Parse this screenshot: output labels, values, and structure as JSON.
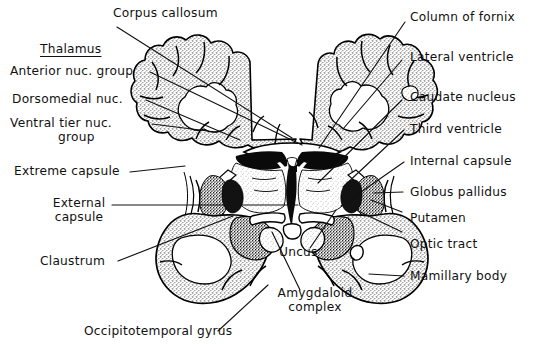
{
  "figure": {
    "ink_color": "#111111",
    "background_color": "#ffffff"
  },
  "labels": {
    "corpus_callosum": "Corpus callosum",
    "thalamus_heading": "Thalamus",
    "anterior_nuc_group": "Anterior nuc. group",
    "dorsomedial_nuc": "Dorsomedial nuc.",
    "ventral_tier_line1": "Ventral tier nuc.",
    "ventral_tier_line2": "group",
    "extreme_capsule": "Extreme capsule",
    "external_capsule_line1": "External",
    "external_capsule_line2": "capsule",
    "claustrum": "Claustrum",
    "occipitotemporal_gyrus": "Occipitotemporal gyrus",
    "amygdaloid_line1": "Amygdaloid",
    "amygdaloid_line2": "complex",
    "uncus": "Uncus",
    "column_of_fornix": "Column of fornix",
    "lateral_ventricle": "Lateral ventricle",
    "caudate_nucleus": "Caudate nucleus",
    "third_ventricle": "Third  ventricle",
    "internal_capsule": "Internal capsule",
    "globus_pallidus": "Globus pallidus",
    "putamen": "Putamen",
    "optic_tract": "Optic tract",
    "mamillary_body": "Mamillary body"
  },
  "leader_lines": [
    {
      "name": "corpus-callosum-leader",
      "points": "117,27 292,138"
    },
    {
      "name": "anterior-nuc-leader",
      "points": "150,72 302,145"
    },
    {
      "name": "dorsomedial-leader",
      "points": "146,100 240,140"
    },
    {
      "name": "ventral-tier-leader",
      "points": "152,124 216,132"
    },
    {
      "name": "extreme-capsule-leader",
      "points": "130,172 185,166"
    },
    {
      "name": "external-capsule-leader",
      "points": "112,205 298,205"
    },
    {
      "name": "claustrum-leader",
      "points": "118,261 233,216"
    },
    {
      "name": "occipitotemporal-leader",
      "points": "218,331 268,285"
    },
    {
      "name": "amygdaloid-leader",
      "points": "300,290 272,232"
    },
    {
      "name": "uncus-leader",
      "points": "310,248 336,210"
    },
    {
      "name": "fornix-leader",
      "points": "405,22 319,148"
    },
    {
      "name": "lateral-ventricle-leader",
      "points": "402,60 343,129"
    },
    {
      "name": "caudate-leader",
      "points": "402,100 318,183"
    },
    {
      "name": "third-ventricle-leader",
      "points": "404,130 343,187"
    },
    {
      "name": "internal-capsule-leader",
      "points": "404,162 341,206"
    },
    {
      "name": "globus-pallidus-leader",
      "points": "403,192 374,193"
    },
    {
      "name": "putamen-leader",
      "points": "402,212 371,200"
    },
    {
      "name": "optic-tract-leader",
      "points": "402,232 352,208"
    },
    {
      "name": "mamillary-body-leader",
      "points": "404,276 369,274"
    }
  ]
}
